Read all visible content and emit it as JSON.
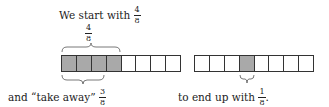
{
  "top_label": {
    "text": "We start with",
    "fraction": {
      "num": "4",
      "den": "8"
    }
  },
  "brace_top_label": {
    "num": "4",
    "den": "8"
  },
  "bottom_left_label": {
    "text": "and “take away”",
    "fraction": {
      "num": "3",
      "den": "8"
    }
  },
  "bottom_right_label": {
    "text": "to end up with",
    "fraction": {
      "num": "1",
      "den": "8"
    },
    "suffix": "."
  },
  "left_bar": {
    "cells": 8,
    "shaded": [
      0,
      1,
      2,
      3
    ]
  },
  "right_bar": {
    "cells": 8,
    "shaded": [
      3
    ]
  },
  "colors": {
    "shaded": "#a9a9a9",
    "border": "#333333",
    "empty": "#ffffff"
  }
}
